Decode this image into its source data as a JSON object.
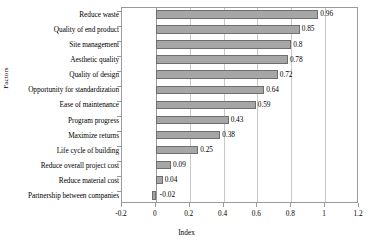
{
  "chart_data": {
    "type": "bar",
    "orientation": "horizontal",
    "title": "",
    "xlabel": "Index",
    "ylabel": "Factors",
    "xlim": [
      -0.2,
      1.2
    ],
    "xticks": [
      -0.2,
      0,
      0.2,
      0.4,
      0.6,
      0.8,
      1,
      1.2
    ],
    "xtick_labels": [
      "-0.2",
      "0",
      "0.2",
      "0.4",
      "0.6",
      "0.8",
      "1",
      "1.2"
    ],
    "grid": true,
    "grid_axis": "x",
    "legend": false,
    "bar_color": "#a6a6a6",
    "bar_edge_color": "#6e6e6e",
    "categories": [
      "Reduce waste",
      "Quality of end product",
      "Site management",
      "Aesthetic quality",
      "Quality of design",
      "Opportunity for standardization",
      "Ease of maintenance",
      "Program progress",
      "Maximize returns",
      "Life cycle of building",
      "Reduce overall project cost",
      "Reduce material cost",
      "Partnership between companies"
    ],
    "values": [
      0.96,
      0.85,
      0.8,
      0.78,
      0.72,
      0.64,
      0.59,
      0.43,
      0.38,
      0.25,
      0.09,
      0.04,
      -0.02
    ],
    "value_labels": [
      "0.96",
      "0.85",
      "0.8",
      "0.78",
      "0.72",
      "0.64",
      "0.59",
      "0.43",
      "0.38",
      "0.25",
      "0.09",
      "0.04",
      "-0.02"
    ]
  }
}
